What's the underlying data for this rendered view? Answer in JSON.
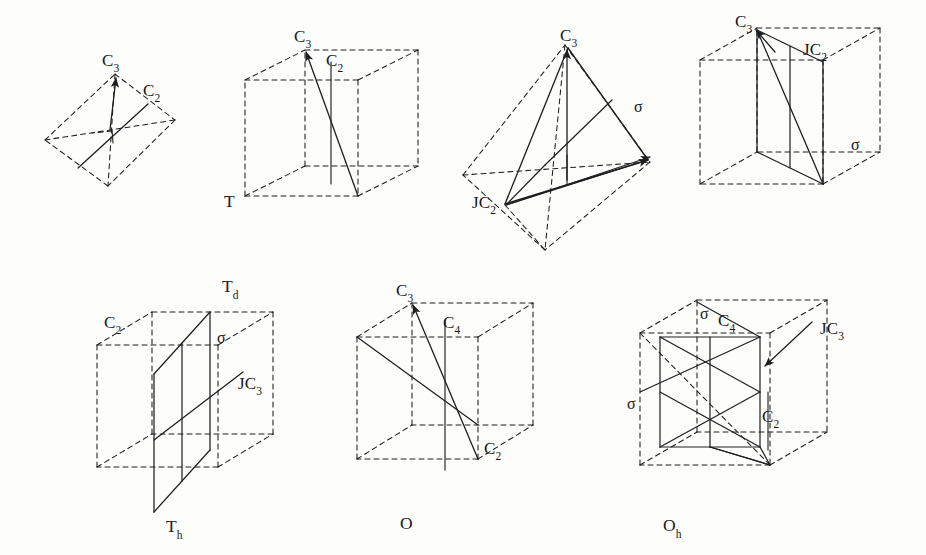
{
  "figure": {
    "background_color": "#fdfdfb",
    "line_color": "#1c1e20",
    "width": 926,
    "height": 555
  },
  "panels": [
    {
      "id": "panel-1",
      "shape": "tetrahedron",
      "caption": "",
      "labels": [
        {
          "name": "c3-axis-label",
          "text": "C",
          "sub": "3",
          "x": 102,
          "y": 52
        },
        {
          "name": "c2-axis-label",
          "text": "C",
          "sub": "2",
          "x": 143,
          "y": 82
        }
      ]
    },
    {
      "id": "panel-2",
      "shape": "cube",
      "caption": "T",
      "caption_sub": "",
      "caption_x": 224,
      "caption_y": 193,
      "labels": [
        {
          "name": "c3-axis-label",
          "text": "C",
          "sub": "3",
          "x": 294,
          "y": 28
        },
        {
          "name": "c2-axis-label",
          "text": "C",
          "sub": "2",
          "x": 326,
          "y": 52
        }
      ]
    },
    {
      "id": "panel-3",
      "shape": "tetrahedron",
      "caption": "",
      "labels": [
        {
          "name": "c3-axis-label",
          "text": "C",
          "sub": "3",
          "x": 560,
          "y": 27
        },
        {
          "name": "jc2-axis-label",
          "text": "JC",
          "sub": "2",
          "x": 472,
          "y": 194
        },
        {
          "name": "sigma-plane-label",
          "text": "σ",
          "sub": "",
          "x": 634,
          "y": 99
        }
      ]
    },
    {
      "id": "panel-4",
      "shape": "cube",
      "caption": "T",
      "caption_sub": "d",
      "caption_x": 222,
      "caption_y": 278,
      "labels": [
        {
          "name": "c3-axis-label",
          "text": "C",
          "sub": "3",
          "x": 735,
          "y": 13
        },
        {
          "name": "jc2-axis-label",
          "text": "JC",
          "sub": "2",
          "x": 803,
          "y": 41
        },
        {
          "name": "sigma-plane-label",
          "text": "σ",
          "sub": "",
          "x": 851,
          "y": 137
        }
      ]
    },
    {
      "id": "panel-5",
      "shape": "cube",
      "caption": "T",
      "caption_sub": "h",
      "caption_x": 166,
      "caption_y": 518,
      "labels": [
        {
          "name": "c2-axis-label",
          "text": "C",
          "sub": "2",
          "x": 104,
          "y": 314
        },
        {
          "name": "sigma-plane-label",
          "text": "σ",
          "sub": "",
          "x": 217,
          "y": 330
        },
        {
          "name": "jc3-axis-label",
          "text": "JC",
          "sub": "3",
          "x": 238,
          "y": 375
        }
      ]
    },
    {
      "id": "panel-6",
      "shape": "cube",
      "caption": "O",
      "caption_sub": "",
      "caption_x": 400,
      "caption_y": 515,
      "labels": [
        {
          "name": "c3-axis-label",
          "text": "C",
          "sub": "3",
          "x": 396,
          "y": 282
        },
        {
          "name": "c4-axis-label",
          "text": "C",
          "sub": "4",
          "x": 443,
          "y": 314
        },
        {
          "name": "c2-axis-label",
          "text": "C",
          "sub": "2",
          "x": 484,
          "y": 440
        }
      ]
    },
    {
      "id": "panel-7",
      "shape": "cube",
      "caption": "O",
      "caption_sub": "h",
      "caption_x": 663,
      "caption_y": 517,
      "labels": [
        {
          "name": "sigma-top-label",
          "text": "σ",
          "sub": "",
          "x": 700,
          "y": 306
        },
        {
          "name": "c4-axis-label",
          "text": "C",
          "sub": "4",
          "x": 718,
          "y": 312
        },
        {
          "name": "jc3-axis-label",
          "text": "JC",
          "sub": "3",
          "x": 820,
          "y": 320
        },
        {
          "name": "c2-axis-label",
          "text": "C",
          "sub": "2",
          "x": 762,
          "y": 408
        },
        {
          "name": "sigma-left-label",
          "text": "σ",
          "sub": "",
          "x": 627,
          "y": 396
        }
      ]
    }
  ]
}
